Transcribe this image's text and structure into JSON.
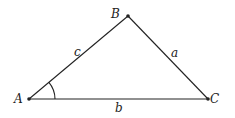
{
  "diagram": {
    "type": "triangle",
    "vertices": [
      {
        "id": "A",
        "label": "A",
        "x": 29,
        "y": 99
      },
      {
        "id": "B",
        "label": "B",
        "x": 128,
        "y": 16
      },
      {
        "id": "C",
        "label": "C",
        "x": 208,
        "y": 99
      }
    ],
    "sides": [
      {
        "id": "c",
        "label": "c",
        "from": "A",
        "to": "B"
      },
      {
        "id": "a",
        "label": "a",
        "from": "B",
        "to": "C"
      },
      {
        "id": "b",
        "label": "b",
        "from": "A",
        "to": "C"
      }
    ],
    "angle_marker": {
      "at": "A",
      "description": "arc marking angle A"
    },
    "colors": {
      "stroke": "#222222",
      "background": "#ffffff"
    }
  }
}
